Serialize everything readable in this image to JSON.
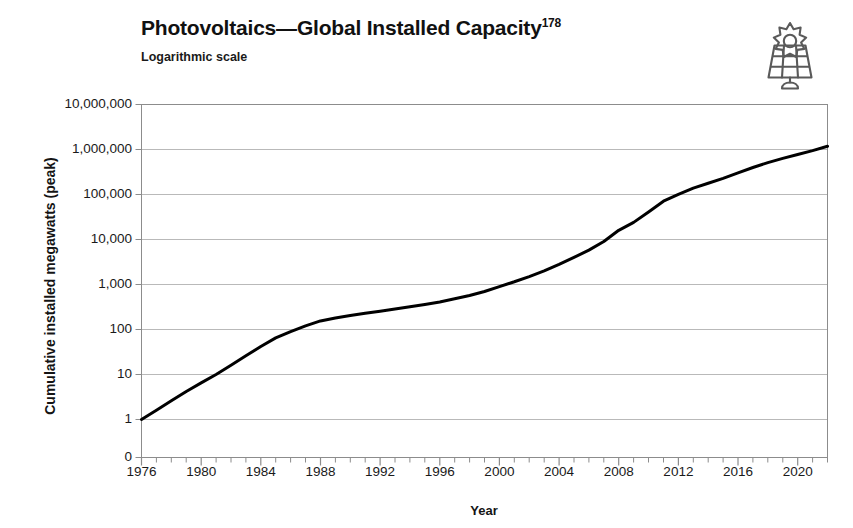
{
  "header": {
    "title": "Photovoltaics—Global Installed Capacity",
    "title_superscript": "178",
    "subtitle": "Logarithmic scale",
    "icon": "solar-panel-icon"
  },
  "colors": {
    "line": "#000000",
    "grid": "#b9b9b9",
    "border": "#8c8c8c",
    "text": "#1a1a1a",
    "background": "#ffffff"
  },
  "chart_data": {
    "type": "line",
    "title": "Photovoltaics—Global Installed Capacity",
    "subtitle": "Logarithmic scale",
    "xlabel": "Year",
    "ylabel": "Cumulative installed megawatts (peak)",
    "yscale": "log",
    "xlim": [
      1976,
      2022
    ],
    "ylim": [
      1,
      10000000
    ],
    "grid": true,
    "legend": null,
    "x_ticks": [
      1976,
      1980,
      1984,
      1988,
      1992,
      1996,
      2000,
      2004,
      2008,
      2012,
      2016,
      2020
    ],
    "x_minor_tick_interval": 1,
    "y_ticks": [
      0,
      1,
      10,
      100,
      1000,
      10000,
      100000,
      1000000,
      10000000
    ],
    "y_tick_labels": [
      "0",
      "1",
      "10",
      "100",
      "1,000",
      "10,000",
      "100,000",
      "1,000,000",
      "10,000,000"
    ],
    "series": [
      {
        "name": "Cumulative installed megawatts (peak)",
        "x": [
          1976,
          1977,
          1978,
          1979,
          1980,
          1981,
          1982,
          1983,
          1984,
          1985,
          1986,
          1987,
          1988,
          1989,
          1990,
          1991,
          1992,
          1993,
          1994,
          1995,
          1996,
          1997,
          1998,
          1999,
          2000,
          2001,
          2002,
          2003,
          2004,
          2005,
          2006,
          2007,
          2008,
          2009,
          2010,
          2011,
          2012,
          2013,
          2014,
          2015,
          2016,
          2017,
          2018,
          2019,
          2020,
          2021,
          2022
        ],
        "values": [
          1,
          1.6,
          2.6,
          4.2,
          6.5,
          10,
          16,
          26,
          42,
          65,
          90,
          120,
          155,
          180,
          205,
          230,
          255,
          285,
          320,
          360,
          410,
          480,
          570,
          700,
          900,
          1150,
          1500,
          2000,
          2800,
          4000,
          5800,
          9000,
          16000,
          24000,
          41000,
          71000,
          101000,
          139000,
          178000,
          228000,
          302000,
          398000,
          512000,
          635000,
          773000,
          945000,
          1180000
        ]
      }
    ],
    "annotations": []
  },
  "axis": {
    "x_title": "Year",
    "y_title": "Cumulative installed megawatts (peak)"
  }
}
